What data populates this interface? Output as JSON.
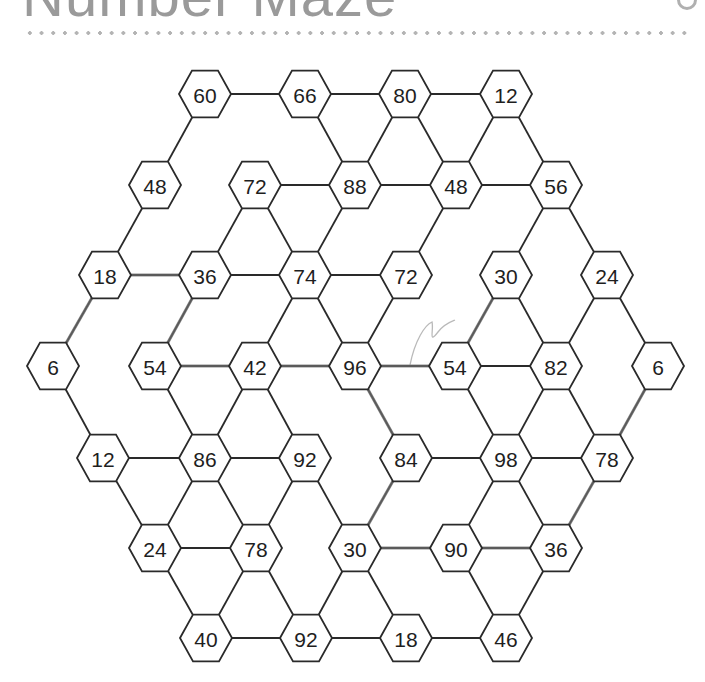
{
  "page": {
    "title": "Number Maze"
  },
  "maze": {
    "hex_radius": 26,
    "nodes": [
      {
        "id": "r1c1",
        "value": "60",
        "x": 205,
        "y": 94
      },
      {
        "id": "r1c2",
        "value": "66",
        "x": 305,
        "y": 94
      },
      {
        "id": "r1c3",
        "value": "80",
        "x": 405,
        "y": 94
      },
      {
        "id": "r1c4",
        "value": "12",
        "x": 506,
        "y": 94
      },
      {
        "id": "r2c1",
        "value": "48",
        "x": 155,
        "y": 185
      },
      {
        "id": "r2c2",
        "value": "72",
        "x": 255,
        "y": 185
      },
      {
        "id": "r2c3",
        "value": "88",
        "x": 355,
        "y": 185
      },
      {
        "id": "r2c4",
        "value": "48",
        "x": 456,
        "y": 185
      },
      {
        "id": "r2c5",
        "value": "56",
        "x": 556,
        "y": 185
      },
      {
        "id": "r3c1",
        "value": "18",
        "x": 105,
        "y": 275
      },
      {
        "id": "r3c2",
        "value": "36",
        "x": 205,
        "y": 275
      },
      {
        "id": "r3c3",
        "value": "74",
        "x": 305,
        "y": 275
      },
      {
        "id": "r3c4",
        "value": "72",
        "x": 406,
        "y": 275
      },
      {
        "id": "r3c5",
        "value": "30",
        "x": 506,
        "y": 275
      },
      {
        "id": "r3c6",
        "value": "24",
        "x": 607,
        "y": 275
      },
      {
        "id": "r4c1",
        "value": "6",
        "x": 53,
        "y": 366
      },
      {
        "id": "r4c2",
        "value": "54",
        "x": 155,
        "y": 366
      },
      {
        "id": "r4c3",
        "value": "42",
        "x": 255,
        "y": 366
      },
      {
        "id": "r4c4",
        "value": "96",
        "x": 355,
        "y": 366
      },
      {
        "id": "r4c5",
        "value": "54",
        "x": 455,
        "y": 366
      },
      {
        "id": "r4c6",
        "value": "82",
        "x": 556,
        "y": 366
      },
      {
        "id": "r4c7",
        "value": "6",
        "x": 658,
        "y": 366
      },
      {
        "id": "r5c1",
        "value": "12",
        "x": 103,
        "y": 458
      },
      {
        "id": "r5c2",
        "value": "86",
        "x": 205,
        "y": 458
      },
      {
        "id": "r5c3",
        "value": "92",
        "x": 305,
        "y": 458
      },
      {
        "id": "r5c4",
        "value": "84",
        "x": 406,
        "y": 458
      },
      {
        "id": "r5c5",
        "value": "98",
        "x": 506,
        "y": 458
      },
      {
        "id": "r5c6",
        "value": "78",
        "x": 607,
        "y": 458
      },
      {
        "id": "r6c1",
        "value": "24",
        "x": 155,
        "y": 548
      },
      {
        "id": "r6c2",
        "value": "78",
        "x": 256,
        "y": 548
      },
      {
        "id": "r6c3",
        "value": "30",
        "x": 355,
        "y": 548
      },
      {
        "id": "r6c4",
        "value": "90",
        "x": 456,
        "y": 548
      },
      {
        "id": "r6c5",
        "value": "36",
        "x": 556,
        "y": 548
      },
      {
        "id": "r7c1",
        "value": "40",
        "x": 206,
        "y": 638
      },
      {
        "id": "r7c2",
        "value": "92",
        "x": 306,
        "y": 638
      },
      {
        "id": "r7c3",
        "value": "18",
        "x": 406,
        "y": 638
      },
      {
        "id": "r7c4",
        "value": "46",
        "x": 506,
        "y": 638
      }
    ],
    "edges": [
      [
        "r1c1",
        "r1c2"
      ],
      [
        "r1c2",
        "r1c3"
      ],
      [
        "r1c3",
        "r1c4"
      ],
      [
        "r1c1",
        "r2c1"
      ],
      [
        "r1c2",
        "r2c3"
      ],
      [
        "r1c3",
        "r2c3"
      ],
      [
        "r1c3",
        "r2c4"
      ],
      [
        "r1c4",
        "r2c4"
      ],
      [
        "r1c4",
        "r2c5"
      ],
      [
        "r2c2",
        "r2c3"
      ],
      [
        "r2c3",
        "r2c4"
      ],
      [
        "r2c4",
        "r2c5"
      ],
      [
        "r2c1",
        "r3c1"
      ],
      [
        "r2c2",
        "r3c2"
      ],
      [
        "r2c2",
        "r3c3"
      ],
      [
        "r2c3",
        "r3c3"
      ],
      [
        "r2c4",
        "r3c4"
      ],
      [
        "r2c5",
        "r3c5"
      ],
      [
        "r2c5",
        "r3c6"
      ],
      [
        "r3c1",
        "r3c2"
      ],
      [
        "r3c2",
        "r3c3"
      ],
      [
        "r3c3",
        "r3c4"
      ],
      [
        "r3c1",
        "r4c1"
      ],
      [
        "r3c2",
        "r4c2"
      ],
      [
        "r3c3",
        "r4c3"
      ],
      [
        "r3c3",
        "r4c4"
      ],
      [
        "r3c4",
        "r4c4"
      ],
      [
        "r3c5",
        "r4c5"
      ],
      [
        "r3c5",
        "r4c6"
      ],
      [
        "r3c6",
        "r4c6"
      ],
      [
        "r3c6",
        "r4c7"
      ],
      [
        "r4c2",
        "r4c3"
      ],
      [
        "r4c3",
        "r4c4"
      ],
      [
        "r4c4",
        "r4c5"
      ],
      [
        "r4c5",
        "r4c6"
      ],
      [
        "r4c1",
        "r5c1"
      ],
      [
        "r4c2",
        "r5c2"
      ],
      [
        "r4c3",
        "r5c2"
      ],
      [
        "r4c3",
        "r5c3"
      ],
      [
        "r4c4",
        "r5c4"
      ],
      [
        "r4c5",
        "r5c5"
      ],
      [
        "r4c6",
        "r5c5"
      ],
      [
        "r4c6",
        "r5c6"
      ],
      [
        "r4c7",
        "r5c6"
      ],
      [
        "r5c1",
        "r5c2"
      ],
      [
        "r5c2",
        "r5c3"
      ],
      [
        "r5c4",
        "r5c5"
      ],
      [
        "r5c5",
        "r5c6"
      ],
      [
        "r5c1",
        "r6c1"
      ],
      [
        "r5c2",
        "r6c1"
      ],
      [
        "r5c2",
        "r6c2"
      ],
      [
        "r5c3",
        "r6c2"
      ],
      [
        "r5c3",
        "r6c3"
      ],
      [
        "r5c4",
        "r6c3"
      ],
      [
        "r5c5",
        "r6c4"
      ],
      [
        "r5c5",
        "r6c5"
      ],
      [
        "r5c6",
        "r6c5"
      ],
      [
        "r6c1",
        "r6c2"
      ],
      [
        "r6c3",
        "r6c4"
      ],
      [
        "r6c4",
        "r6c5"
      ],
      [
        "r6c1",
        "r7c1"
      ],
      [
        "r6c2",
        "r7c1"
      ],
      [
        "r6c2",
        "r7c2"
      ],
      [
        "r6c3",
        "r7c2"
      ],
      [
        "r6c3",
        "r7c3"
      ],
      [
        "r6c4",
        "r7c4"
      ],
      [
        "r6c5",
        "r7c4"
      ],
      [
        "r7c1",
        "r7c2"
      ],
      [
        "r7c2",
        "r7c3"
      ],
      [
        "r7c3",
        "r7c4"
      ]
    ],
    "pencil_path": [
      "r4c1",
      "r3c1",
      "r3c2",
      "r4c2",
      "r4c3",
      "r4c4",
      "r5c4",
      "r6c3",
      "r6c4",
      "r6c5",
      "r5c6",
      "r4c7"
    ],
    "pencil_extra": [
      [
        "r4c4",
        "r4c5"
      ],
      [
        "r4c5",
        "r3c5"
      ]
    ]
  }
}
